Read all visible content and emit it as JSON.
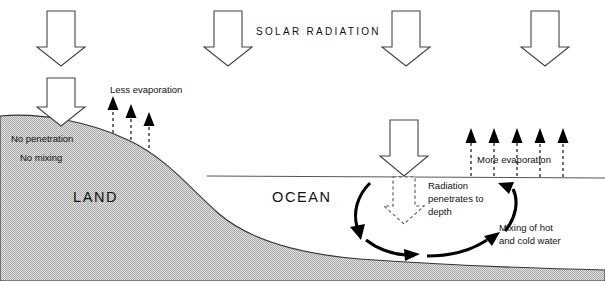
{
  "diagram": {
    "title_text": "SOLAR RADIATION",
    "regions": {
      "land_label": "LAND",
      "ocean_label": "OCEAN"
    },
    "land_notes": [
      "No penetration",
      "No mixing"
    ],
    "labels": {
      "less_evaporation": "Less evaporation",
      "more_evaporation": "More evaporation",
      "radiation_line1": "Radiation",
      "radiation_line2": "penetrates to",
      "radiation_line3": "depth",
      "mixing_line1": "Mixing of hot",
      "mixing_line2": "and cold water"
    },
    "colors": {
      "land_fill": "#c9c9c9",
      "outline": "#333333",
      "text": "#111111",
      "arrow_solid": "#000000",
      "arrow_hollow_stroke": "#444444",
      "background": "#ffffff"
    },
    "icons": {
      "solar_arrow": "down-arrow-hollow-icon",
      "evaporation_arrow": "up-arrow-dashed-icon",
      "circulation_arrow": "curved-arrow-icon",
      "penetration_arrow": "down-arrow-dashed-hollow-icon"
    },
    "counts": {
      "solar_arrows": 4,
      "land_evaporation_arrows": 3,
      "ocean_evaporation_arrows": 5
    }
  }
}
